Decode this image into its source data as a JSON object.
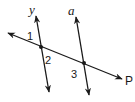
{
  "diagram": {
    "type": "geometry-parallel-lines-transversal",
    "colors": {
      "stroke": "#1a1a1a",
      "background": "#ffffff"
    },
    "lines": [
      {
        "name": "y",
        "x1": 36,
        "y1": 16,
        "x2": 49,
        "y2": 92
      },
      {
        "name": "a",
        "x1": 76,
        "y1": 17,
        "x2": 89,
        "y2": 95
      },
      {
        "name": "P",
        "x1": 8,
        "y1": 33,
        "x2": 122,
        "y2": 79
      }
    ],
    "intersections": [
      {
        "x": 41,
        "y": 47
      },
      {
        "x": 84,
        "y": 63
      }
    ],
    "labels": {
      "line_y": "y",
      "line_a": "a",
      "line_p": "P",
      "angle_1": "1",
      "angle_2": "2",
      "angle_3": "3"
    }
  }
}
